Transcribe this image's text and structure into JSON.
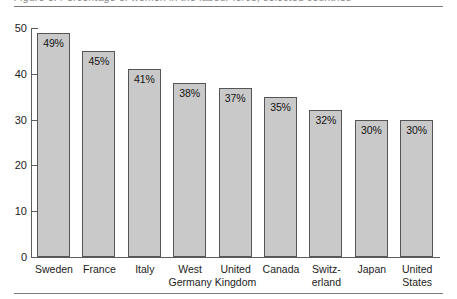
{
  "figure": {
    "title_sliver": "Figure 3. Percentage of women in the labour force, selected countries"
  },
  "chart_data": {
    "type": "bar",
    "title": "",
    "xlabel": "",
    "ylabel": "",
    "ylim": [
      0,
      50
    ],
    "yticks": [
      0,
      10,
      20,
      30,
      40,
      50
    ],
    "ytick_labels": [
      "0",
      "10",
      "20",
      "30",
      "40",
      "50"
    ],
    "grid": false,
    "legend": "none",
    "categories": [
      "Sweden",
      "France",
      "Italy",
      "West Germany",
      "United Kingdom",
      "Canada",
      "Switzerland",
      "Japan",
      "United States"
    ],
    "category_lines": [
      [
        "Sweden"
      ],
      [
        "France"
      ],
      [
        "Italy"
      ],
      [
        "West",
        "Germany"
      ],
      [
        "United",
        "Kingdom"
      ],
      [
        "Canada"
      ],
      [
        "Switz-",
        "erland"
      ],
      [
        "Japan"
      ],
      [
        "United",
        "States"
      ]
    ],
    "values": [
      49,
      45,
      41,
      38,
      37,
      35,
      32,
      30,
      30
    ],
    "data_labels": [
      "49%",
      "45%",
      "41%",
      "38%",
      "37%",
      "35%",
      "32%",
      "30%",
      "30%"
    ],
    "colors": {
      "bar_fill": "#c9c9c9",
      "bar_border": "#555555",
      "axis": "#5d5d5d",
      "text": "#1c1c1c",
      "rule": "#7a7a7a"
    }
  }
}
